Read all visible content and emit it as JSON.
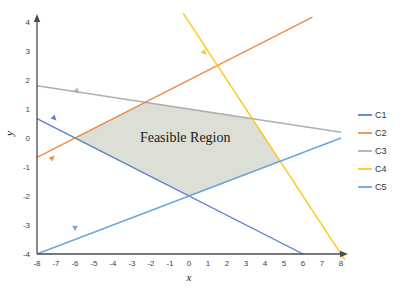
{
  "chart_data": {
    "type": "line",
    "title": "",
    "region_label": "Feasible Region",
    "xlabel": "x",
    "ylabel": "y",
    "xlim": [
      -8,
      8
    ],
    "ylim": [
      -4,
      4
    ],
    "x_ticks": [
      -8,
      -7,
      -6,
      -5,
      -4,
      -3,
      -2,
      -1,
      0,
      1,
      2,
      3,
      4,
      5,
      6,
      7,
      8
    ],
    "y_ticks": [
      -4,
      -3,
      -2,
      -1,
      0,
      1,
      2,
      3,
      4
    ],
    "grid": false,
    "legend_position": "right",
    "axis_color": "#4a4a4a",
    "tick_color": "#3f3f3f",
    "series": [
      {
        "name": "C1",
        "color": "#4472C4",
        "points": [
          [
            -8,
            0.667
          ],
          [
            6,
            -4
          ]
        ]
      },
      {
        "name": "C2",
        "color": "#ED7D31",
        "points": [
          [
            -8,
            -0.667
          ],
          [
            6.5,
            4.167
          ]
        ]
      },
      {
        "name": "C3",
        "color": "#A5A5A5",
        "points": [
          [
            -8,
            1.8
          ],
          [
            8,
            0.2
          ]
        ]
      },
      {
        "name": "C4",
        "color": "#FFC000",
        "points": [
          [
            -0.3,
            4.3
          ],
          [
            8.2,
            -4.2
          ]
        ]
      },
      {
        "name": "C5",
        "color": "#5B9BD5",
        "points": [
          [
            -8,
            -4
          ],
          [
            8,
            0
          ]
        ]
      }
    ],
    "feasible_region": {
      "fill": "#D7DCD2",
      "vertices": [
        [
          -6,
          0
        ],
        [
          -2.31,
          1.23
        ],
        [
          3.33,
          0.67
        ],
        [
          4.8,
          -0.8
        ],
        [
          0,
          -2
        ]
      ]
    },
    "direction_markers": [
      {
        "series": "C1",
        "x": -7.1,
        "y": 0.69,
        "angle": 135
      },
      {
        "series": "C2",
        "x": -7.2,
        "y": -0.69,
        "angle": 45
      },
      {
        "series": "C3",
        "x": -5.9,
        "y": 1.62,
        "angle": 135
      },
      {
        "series": "C4",
        "x": 0.8,
        "y": 2.95,
        "angle": 135
      },
      {
        "series": "C5",
        "x": -6.0,
        "y": -3.1,
        "angle": 180
      }
    ]
  }
}
